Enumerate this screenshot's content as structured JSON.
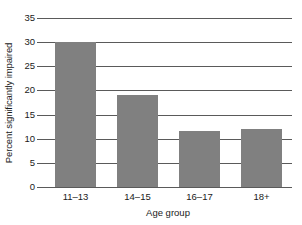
{
  "chart_data": {
    "type": "bar",
    "title": "",
    "categories": [
      "11–13",
      "14–15",
      "16–17",
      "18+"
    ],
    "values": [
      30,
      19,
      11.5,
      12
    ],
    "xlabel": "Age group",
    "ylabel": "Percent significantly impaired",
    "ylim": [
      0,
      35
    ],
    "ytick_labels": [
      "0",
      "5",
      "10",
      "15",
      "20",
      "25",
      "30",
      "35"
    ],
    "ytick_values": [
      0,
      5,
      10,
      15,
      20,
      25,
      30,
      35
    ],
    "grid": true,
    "legend": false,
    "bar_color": "#808080",
    "axis_color": "#5a5a5a",
    "background_color": "#ffffff"
  }
}
